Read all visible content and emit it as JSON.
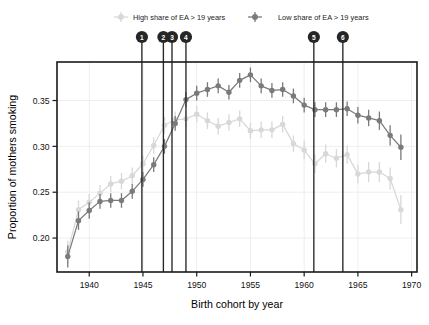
{
  "chart_data": {
    "type": "line",
    "title": "",
    "xlabel": "Birth cohort by year",
    "ylabel": "Proportion of mothers smoking",
    "xlim": [
      1937,
      1970.5
    ],
    "ylim": [
      0.163,
      0.392
    ],
    "xticks": [
      1940,
      1945,
      1950,
      1955,
      1960,
      1965,
      1970
    ],
    "yticks": [
      0.2,
      0.25,
      0.3,
      0.35
    ],
    "xtick_labels": [
      "1940",
      "1945",
      "1950",
      "1955",
      "1960",
      "1965",
      "1970"
    ],
    "ytick_labels": [
      "0.20",
      "0.25",
      "0.30",
      "0.35"
    ],
    "grid": true,
    "legend_position": "top",
    "error_bars": true,
    "x": [
      1938,
      1939,
      1940,
      1941,
      1942,
      1943,
      1944,
      1945,
      1946,
      1947,
      1948,
      1949,
      1950,
      1951,
      1952,
      1953,
      1954,
      1955,
      1956,
      1957,
      1958,
      1959,
      1960,
      1961,
      1962,
      1963,
      1964,
      1965,
      1966,
      1967,
      1968,
      1969
    ],
    "series": [
      {
        "name": "High share of EA > 19 years",
        "color": "#d8d8d8",
        "values": [
          0.185,
          0.231,
          0.239,
          0.249,
          0.259,
          0.262,
          0.268,
          0.281,
          0.301,
          0.323,
          0.329,
          0.33,
          0.335,
          0.328,
          0.322,
          0.326,
          0.33,
          0.317,
          0.318,
          0.318,
          0.324,
          0.303,
          0.296,
          0.281,
          0.292,
          0.287,
          0.291,
          0.27,
          0.272,
          0.272,
          0.265,
          0.231
        ],
        "errors": [
          0.012,
          0.01,
          0.009,
          0.009,
          0.009,
          0.009,
          0.009,
          0.009,
          0.009,
          0.009,
          0.009,
          0.009,
          0.009,
          0.009,
          0.009,
          0.009,
          0.009,
          0.009,
          0.009,
          0.009,
          0.009,
          0.009,
          0.01,
          0.01,
          0.01,
          0.01,
          0.01,
          0.01,
          0.011,
          0.011,
          0.012,
          0.016
        ]
      },
      {
        "name": "Low share of EA > 19 years",
        "color": "#7a7a7a",
        "values": [
          0.18,
          0.219,
          0.23,
          0.24,
          0.241,
          0.241,
          0.251,
          0.264,
          0.28,
          0.3,
          0.325,
          0.351,
          0.358,
          0.362,
          0.366,
          0.359,
          0.372,
          0.378,
          0.366,
          0.361,
          0.362,
          0.355,
          0.345,
          0.34,
          0.34,
          0.34,
          0.341,
          0.334,
          0.331,
          0.328,
          0.312,
          0.299
        ],
        "errors": [
          0.012,
          0.01,
          0.009,
          0.008,
          0.008,
          0.008,
          0.008,
          0.008,
          0.008,
          0.008,
          0.008,
          0.008,
          0.008,
          0.008,
          0.008,
          0.008,
          0.008,
          0.008,
          0.008,
          0.008,
          0.008,
          0.008,
          0.008,
          0.008,
          0.008,
          0.008,
          0.008,
          0.009,
          0.009,
          0.01,
          0.011,
          0.014
        ]
      }
    ],
    "event_markers": [
      {
        "label": "1",
        "x": 1944.9
      },
      {
        "label": "2",
        "x": 1946.9
      },
      {
        "label": "3",
        "x": 1947.7
      },
      {
        "label": "4",
        "x": 1949.0
      },
      {
        "label": "5",
        "x": 1960.9
      },
      {
        "label": "6",
        "x": 1963.6
      }
    ],
    "marker_color": "#262626"
  },
  "legend": {
    "entries": [
      {
        "label": "High share of EA > 19 years"
      },
      {
        "label": "Low share of EA > 19 years"
      }
    ]
  },
  "axes": {
    "x_title": "Birth cohort by year",
    "y_title": "Proportion of mothers smoking"
  }
}
